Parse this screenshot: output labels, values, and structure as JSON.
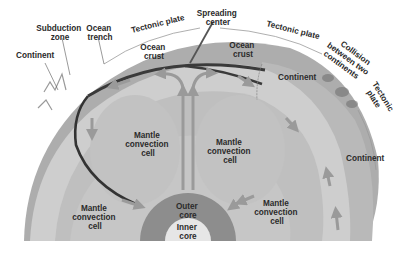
{
  "figure": {
    "colors": {
      "background": "#ffffff",
      "crust": "#a9a9a9",
      "continent": "#b8b8b8",
      "upper_mantle": "#cfcfcf",
      "mantle": "#bdbdbd",
      "outer_core": "#8c8c8c",
      "inner_core": "#e4e4e4",
      "slab": "#3a3a3a",
      "arrow": "#9a9a9a",
      "label": "#2a2a2a"
    }
  },
  "labels": {
    "continent_left": "Continent",
    "subduction_zone": [
      "Subduction",
      "zone"
    ],
    "ocean_trench": [
      "Ocean",
      "trench"
    ],
    "tectonic_plate_1": "Tectonic plate",
    "spreading_center": [
      "Spreading",
      "center"
    ],
    "tectonic_plate_2": "Tectonic plate",
    "collision": [
      "Collision",
      "between two",
      "continents"
    ],
    "tectonic_plate_3": [
      "Tectonic",
      "plate"
    ],
    "ocean_crust_left": [
      "Ocean",
      "crust"
    ],
    "ocean_crust_right": [
      "Ocean",
      "crust"
    ],
    "continent_upper_right": "Continent",
    "continent_right": "Continent",
    "mantle_cell_center_left": [
      "Mantle",
      "convection",
      "cell"
    ],
    "mantle_cell_center_right": [
      "Mantle",
      "convection",
      "cell"
    ],
    "mantle_cell_lower_left": [
      "Mantle",
      "convection",
      "cell"
    ],
    "mantle_cell_lower_right": [
      "Mantle",
      "convection",
      "cell"
    ],
    "outer_core": [
      "Outer",
      "core"
    ],
    "inner_core": [
      "Inner",
      "core"
    ]
  }
}
